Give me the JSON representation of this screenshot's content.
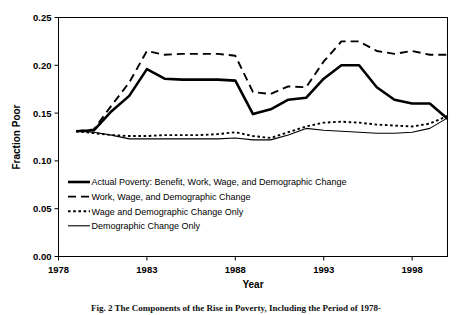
{
  "figure": {
    "caption": "Fig. 2 The Components of the Rise in Poverty, Including the Period of 1978-"
  },
  "chart_data": {
    "type": "line",
    "title": "",
    "xlabel": "Year",
    "ylabel": "Fraction Poor",
    "xlim": [
      1978,
      2000
    ],
    "ylim": [
      0.0,
      0.25
    ],
    "xticks": [
      1978,
      1983,
      1988,
      1993,
      1998
    ],
    "xtick_labels": [
      "1978",
      "1983",
      "1988",
      "1993",
      "1998"
    ],
    "yticks": [
      0.0,
      0.05,
      0.1,
      0.15,
      0.2,
      0.25
    ],
    "ytick_labels": [
      "0.00",
      "0.05",
      "0.10",
      "0.15",
      "0.20",
      "0.25"
    ],
    "grid": false,
    "legend_position": "inside-lower-left",
    "x": [
      1979,
      1980,
      1981,
      1982,
      1983,
      1984,
      1985,
      1986,
      1987,
      1988,
      1989,
      1990,
      1991,
      1992,
      1993,
      1994,
      1995,
      1996,
      1997,
      1998,
      1999,
      2000
    ],
    "series": [
      {
        "name": "Actual Poverty: Benefit, Work, Wage, and Demographic Change",
        "style": "solid-thick",
        "values": [
          0.131,
          0.132,
          0.152,
          0.168,
          0.196,
          0.186,
          0.185,
          0.185,
          0.185,
          0.184,
          0.149,
          0.154,
          0.164,
          0.166,
          0.186,
          0.2,
          0.2,
          0.177,
          0.164,
          0.16,
          0.16,
          0.144
        ]
      },
      {
        "name": "Work, Wage, and Demographic Change",
        "style": "dashed",
        "values": [
          0.131,
          0.133,
          0.158,
          0.182,
          0.215,
          0.211,
          0.212,
          0.212,
          0.212,
          0.21,
          0.172,
          0.17,
          0.178,
          0.177,
          0.204,
          0.225,
          0.225,
          0.215,
          0.212,
          0.215,
          0.211,
          0.211
        ]
      },
      {
        "name": "Wage and Demographic Change Only",
        "style": "dotted",
        "values": [
          0.131,
          0.129,
          0.127,
          0.126,
          0.126,
          0.127,
          0.127,
          0.127,
          0.128,
          0.13,
          0.126,
          0.124,
          0.13,
          0.136,
          0.14,
          0.141,
          0.14,
          0.138,
          0.137,
          0.136,
          0.139,
          0.147
        ]
      },
      {
        "name": "Demographic Change Only",
        "style": "solid-thin",
        "values": [
          0.131,
          0.13,
          0.127,
          0.123,
          0.123,
          0.123,
          0.123,
          0.123,
          0.123,
          0.124,
          0.122,
          0.122,
          0.127,
          0.134,
          0.132,
          0.131,
          0.13,
          0.129,
          0.129,
          0.13,
          0.134,
          0.145
        ]
      }
    ],
    "colors": {
      "line": "#000000",
      "axis": "#000000",
      "background": "#ffffff"
    }
  }
}
